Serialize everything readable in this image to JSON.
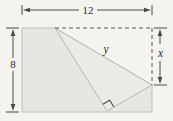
{
  "figure": {
    "labels": {
      "top_width": "12",
      "left_height": "8",
      "crease": "y",
      "right_segment": "x"
    },
    "colors": {
      "background": "#f4f3f0",
      "paper_fill": "#e7e6e2",
      "flap_fill": "#eceae6",
      "paper_edge": "#c0beba",
      "flap_edge": "#b9b7b2",
      "dashed_line": "#5a5957",
      "dimension_line": "#4a4a48",
      "label_text": "#2d2d2b"
    }
  }
}
